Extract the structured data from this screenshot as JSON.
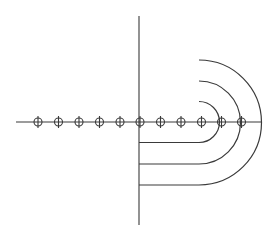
{
  "diagram": {
    "stroke_color": "#3a3a3a",
    "background": "#ffffff",
    "horizontal_axis": {
      "x1": 16,
      "x2": 262,
      "y": 122
    },
    "vertical_axis": {
      "x": 139,
      "y1": 16,
      "y2": 225
    },
    "markers": {
      "radius": 4,
      "tick_half_length": 6,
      "y": 122,
      "x_positions": [
        38,
        58.5,
        79,
        99.5,
        120,
        140,
        160.5,
        181,
        201.5,
        221.5,
        241.5
      ]
    },
    "u_curves": [
      {
        "name": "inner",
        "start_x": 139,
        "straight_end_x": 199,
        "top_y": 101.5,
        "bottom_y": 142.5
      },
      {
        "name": "middle",
        "start_x": 139,
        "straight_end_x": 199,
        "top_y": 81,
        "bottom_y": 164
      },
      {
        "name": "outer",
        "start_x": 139,
        "straight_end_x": 199,
        "top_y": 60,
        "bottom_y": 185
      }
    ]
  }
}
